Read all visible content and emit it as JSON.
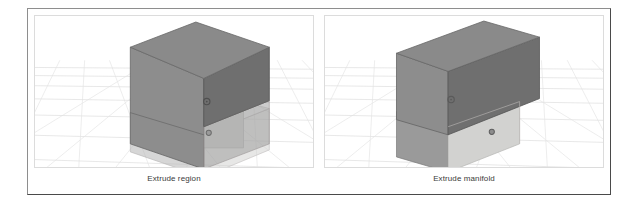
{
  "figure": {
    "frame_color": "#8e8e8e",
    "frame_shadow_color": "#4a4a4a",
    "background": "#ffffff"
  },
  "panels": [
    {
      "id": "left",
      "caption": "Extrude region",
      "viewport_border": "#dcdcdc",
      "grid": {
        "line_color": "#e6e6e6",
        "horizon_color": "#dddddd",
        "visible": true
      },
      "solid": {
        "name": "extruded-box-region",
        "top_face_color": "#8a8a8a",
        "left_face_color": "#8d8d8d",
        "front_face_color": "#6f6f6f",
        "highlight_face_color": "#d4d4d2",
        "ghost_face_color": "#b9b9b9",
        "edge_color": "#5a5a5a",
        "ghost_edge_color": "#c2bdbd"
      },
      "markers": [
        {
          "name": "origin-gizmo",
          "color": "#5b5b5b"
        },
        {
          "name": "face-handle",
          "color": "#7a7a7a"
        }
      ]
    },
    {
      "id": "right",
      "caption": "Extrude manifold",
      "viewport_border": "#dcdcdc",
      "grid": {
        "line_color": "#e6e6e6",
        "horizon_color": "#dddddd",
        "visible": true
      },
      "solid": {
        "name": "extruded-box-manifold",
        "top_face_color": "#8a8a8a",
        "left_face_color": "#8d8d8d",
        "front_face_color": "#6f6f6f",
        "highlight_face_color": "#d4d4d2",
        "ghost_face_color": "#b9b9b9",
        "edge_color": "#5a5a5a",
        "ghost_edge_color": "#c2bdbd"
      },
      "markers": [
        {
          "name": "origin-gizmo",
          "color": "#5b5b5b"
        },
        {
          "name": "face-handle",
          "color": "#7a7a7a"
        }
      ]
    }
  ]
}
